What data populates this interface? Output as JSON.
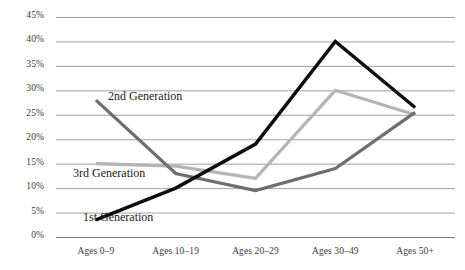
{
  "chart_data": {
    "type": "line",
    "title": "",
    "xlabel": "",
    "ylabel": "",
    "categories": [
      "Ages 0–9",
      "Ages 10–19",
      "Ages 20–29",
      "Ages 30–49",
      "Ages 50+"
    ],
    "ylim": [
      0,
      45
    ],
    "ytick_labels": [
      "0%",
      "5%",
      "10%",
      "15%",
      "20%",
      "25%",
      "30%",
      "35%",
      "40%",
      "45%"
    ],
    "ytick_values": [
      0,
      5,
      10,
      15,
      20,
      25,
      30,
      35,
      40,
      45
    ],
    "grid": true,
    "legend_position": "inline-annotations",
    "series": [
      {
        "name": "1st Generation",
        "color": "#0d0d0d",
        "width": 3.4,
        "values": [
          3.5,
          10.0,
          19.0,
          40.0,
          26.5
        ],
        "label": "1st Generation",
        "label_x": 83,
        "label_y": 210
      },
      {
        "name": "2nd Generation",
        "color": "#6e6e6e",
        "width": 3.2,
        "values": [
          28.0,
          13.0,
          9.5,
          14.0,
          25.5
        ],
        "label": "2nd Generation",
        "label_x": 108,
        "label_y": 89
      },
      {
        "name": "3rd Generation",
        "color": "#b4b4b4",
        "width": 3.2,
        "values": [
          15.0,
          14.5,
          12.0,
          30.0,
          25.0
        ],
        "label": "3rd Generation",
        "label_x": 73,
        "label_y": 166
      }
    ]
  },
  "axis": {
    "grid_color": "#8a8a8a",
    "baseline_color": "#7a7a7a",
    "tick_color": "#3a3a3a"
  }
}
